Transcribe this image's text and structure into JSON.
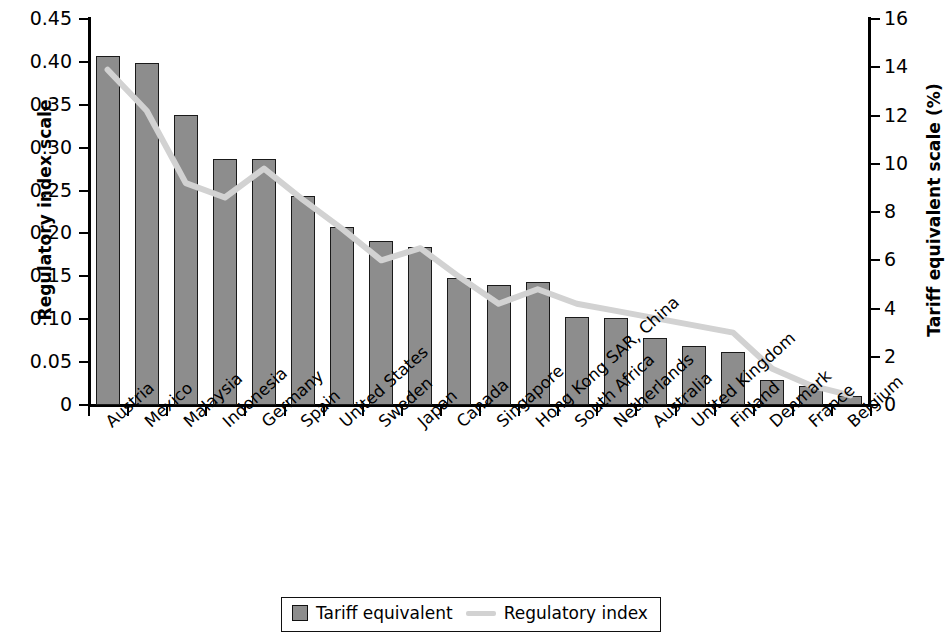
{
  "chart_data": {
    "type": "bar",
    "title": "",
    "subtitle": "",
    "xlabel": "",
    "ylabel": "Regulatory index scale",
    "y2label": "Tariff equivalent scale (%)",
    "grid": false,
    "legend_position": "bottom-center",
    "categories": [
      "Austria",
      "Mexico",
      "Malaysia",
      "Indonesia",
      "Germany",
      "Spain",
      "United States",
      "Sweden",
      "Japan",
      "Canada",
      "Singapore",
      "Hong Kong SAR, China",
      "South Africa",
      "Netherlands",
      "Australia",
      "United Kingdom",
      "Finland",
      "Denmark",
      "France",
      "Belgium"
    ],
    "ylim": [
      0,
      0.45
    ],
    "yticks": [
      "0",
      "0.05",
      "0.10",
      "0.15",
      "0.20",
      "0.25",
      "0.30",
      "0.35",
      "0.40",
      "0.45"
    ],
    "ytick_values": [
      0,
      0.05,
      0.1,
      0.15,
      0.2,
      0.25,
      0.3,
      0.35,
      0.4,
      0.45
    ],
    "y2lim": [
      0,
      16
    ],
    "y2ticks": [
      "0",
      "2",
      "4",
      "6",
      "8",
      "10",
      "12",
      "14",
      "16"
    ],
    "y2tick_values": [
      0,
      2,
      4,
      6,
      8,
      10,
      12,
      14,
      16
    ],
    "series": [
      {
        "name": "Tariff equivalent",
        "type": "bar",
        "axis": "left",
        "color": "#8d8d8d",
        "values": [
          0.407,
          0.399,
          0.338,
          0.287,
          0.287,
          0.244,
          0.208,
          0.191,
          0.184,
          0.148,
          0.14,
          0.143,
          0.103,
          0.102,
          0.078,
          0.069,
          0.062,
          0.029,
          0.022,
          0.011
        ]
      },
      {
        "name": "Regulatory index",
        "type": "line",
        "axis": "right",
        "color": "#d2d2d2",
        "values": [
          13.9,
          12.2,
          9.2,
          8.6,
          9.8,
          8.5,
          7.3,
          6.0,
          6.5,
          5.3,
          4.2,
          4.8,
          4.2,
          3.9,
          3.6,
          3.3,
          3.0,
          1.5,
          0.8,
          0.4
        ]
      }
    ]
  },
  "legend": {
    "items": [
      {
        "label": "Tariff equivalent",
        "marker": "square"
      },
      {
        "label": "Regulatory index",
        "marker": "line"
      }
    ]
  },
  "axes": {
    "left_title": "Regulatory index scale",
    "right_title": "Tariff equivalent scale (%)"
  }
}
